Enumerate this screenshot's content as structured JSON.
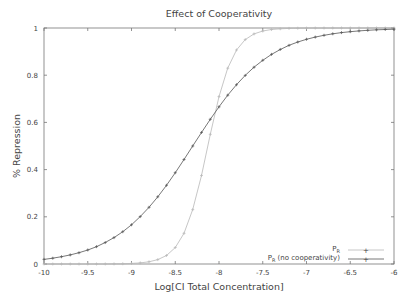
{
  "chart_data": {
    "type": "line",
    "title": "Effect of Cooperativity",
    "xlabel": "Log[CI Total Concentration]",
    "ylabel": "% Repression",
    "xlim": [
      -10,
      -6
    ],
    "ylim": [
      0,
      1
    ],
    "grid": false,
    "legend_position": "lower right",
    "xticks": [
      "-10",
      "-9.5",
      "-9",
      "-8.5",
      "-8",
      "-7.5",
      "-7",
      "-6.5",
      "-6"
    ],
    "yticks": [
      "0",
      "0.2",
      "0.4",
      "0.6",
      "0.8",
      "1"
    ],
    "x": [
      -10,
      -9.9,
      -9.8,
      -9.7,
      -9.6,
      -9.5,
      -9.4,
      -9.3,
      -9.2,
      -9.1,
      -9,
      -8.9,
      -8.8,
      -8.7,
      -8.6,
      -8.5,
      -8.4,
      -8.3,
      -8.2,
      -8.1,
      -8,
      -7.9,
      -7.8,
      -7.7,
      -7.6,
      -7.5,
      -7.4,
      -7.3,
      -7.2,
      -7.1,
      -7,
      -6.9,
      -6.8,
      -6.7,
      -6.6,
      -6.5,
      -6.4,
      -6.3,
      -6.2,
      -6.1,
      -6
    ],
    "series": [
      {
        "name": "P_R",
        "legend_main": "P",
        "legend_sub": "R",
        "legend_suffix": "",
        "color": "#b8b8b8",
        "values": [
          0.0,
          0.0,
          0.0,
          0.0,
          0.0,
          0.0001,
          0.0001,
          0.0002,
          0.0005,
          0.001,
          0.0024,
          0.0047,
          0.0094,
          0.0185,
          0.0362,
          0.0698,
          0.13,
          0.2305,
          0.3751,
          0.5495,
          0.7094,
          0.8297,
          0.9068,
          0.951,
          0.9748,
          0.9871,
          0.9935,
          0.9967,
          0.9984,
          0.9992,
          0.9996,
          0.9998,
          0.9999,
          1.0,
          1.0,
          1.0,
          1.0,
          1.0,
          1.0,
          1.0,
          1.0
        ]
      },
      {
        "name": "P_R (no cooperativity)",
        "legend_main": "P",
        "legend_sub": "R",
        "legend_suffix": " (no cooperativity)",
        "color": "#555555",
        "values": [
          0.0196,
          0.0245,
          0.0308,
          0.0385,
          0.0477,
          0.0594,
          0.0735,
          0.0909,
          0.1118,
          0.1368,
          0.1663,
          0.2009,
          0.2403,
          0.2847,
          0.3335,
          0.3869,
          0.4427,
          0.5,
          0.5573,
          0.6131,
          0.6661,
          0.7153,
          0.7597,
          0.7991,
          0.8337,
          0.8632,
          0.8882,
          0.9091,
          0.9265,
          0.9406,
          0.9523,
          0.9615,
          0.9692,
          0.9755,
          0.9805,
          0.9844,
          0.9876,
          0.9902,
          0.9922,
          0.9938,
          0.995
        ]
      }
    ]
  }
}
